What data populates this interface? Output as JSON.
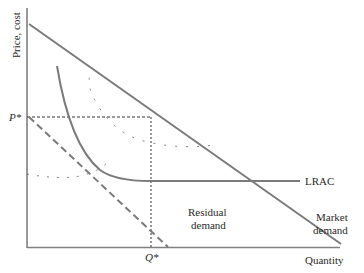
{
  "diagram": {
    "type": "economics-graph",
    "y_axis_label": "Price, cost",
    "x_axis_label": "Quantity",
    "p_star_label": "P*",
    "q_star_label": "Q*",
    "curves": {
      "market_demand": {
        "label_line1": "Market",
        "label_line2": "demand"
      },
      "residual_demand": {
        "label_line1": "Residual",
        "label_line2": "demand"
      },
      "lrac": {
        "label": "LRAC"
      }
    },
    "colors": {
      "curve": "#7a7a7a",
      "axis": "#808080",
      "dotted": "#333333",
      "text": "#2a2a2a"
    }
  }
}
